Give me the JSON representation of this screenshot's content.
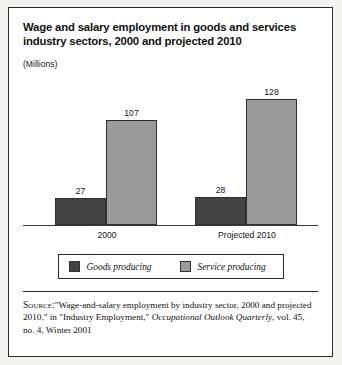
{
  "chart_data": {
    "type": "bar",
    "title": "Wage and salary employment in goods and services industry sectors, 2000 and projected 2010",
    "subtitle": "",
    "unit_label": "(Millions)",
    "xlabel": "",
    "ylabel": "Millions",
    "categories": [
      "2000",
      "Projected 2010"
    ],
    "series": [
      {
        "name": "Goods producing",
        "values": [
          27,
          28
        ],
        "color": "#434343"
      },
      {
        "name": "Service producing",
        "values": [
          107,
          128
        ],
        "color": "#9a9a9a"
      }
    ],
    "value_labels": [
      [
        "27",
        "107"
      ],
      [
        "28",
        "128"
      ]
    ],
    "ylim": [
      0,
      140
    ],
    "grid": false,
    "legend_position": "bottom",
    "axis_baseline": true
  },
  "legend": {
    "items": [
      {
        "label": "Goods producing",
        "swatch": "goods"
      },
      {
        "label": "Service producing",
        "swatch": "service"
      }
    ]
  },
  "source": {
    "label": "Source:",
    "text_before_italic": "\"Wage-and-salary employment by industry sector, 2000 and projected 2010,\" in \"Industry Employment,\" ",
    "italic_text": "Occupational Outlook Quarterly",
    "text_after_italic": ", vol. 45, no. 4, Winter 2001"
  },
  "colors": {
    "goods": "#434343",
    "service": "#9a9a9a",
    "border": "#2b2b2b",
    "background": "#ffffff"
  }
}
